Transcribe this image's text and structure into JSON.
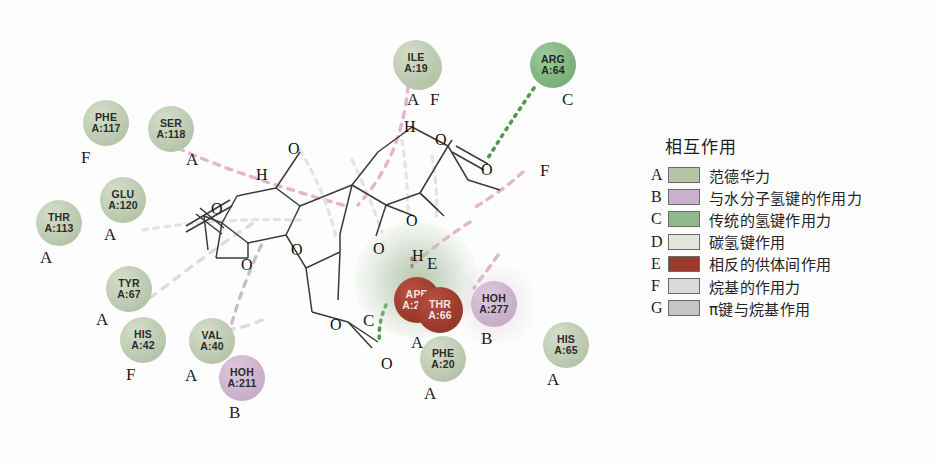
{
  "diagram": {
    "type": "2d-ligand-protein-interaction-map",
    "residues": [
      {
        "id": "ala114",
        "name": "ALA",
        "chain": "A:114",
        "tag": "F",
        "x": 396,
        "y": 44,
        "d": 46,
        "style": "vdw",
        "tag_dx": 34,
        "tag_dy": 46
      },
      {
        "id": "ile19",
        "name": "ILE",
        "chain": "A:19",
        "tag": "A",
        "x": 393,
        "y": 40,
        "d": 46,
        "style": "vdw",
        "tag_dx": 14,
        "tag_dy": 50
      },
      {
        "id": "arg64",
        "name": "ARG",
        "chain": "A:64",
        "tag": "C",
        "x": 530,
        "y": 42,
        "d": 46,
        "style": "conv",
        "tag_dx": 32,
        "tag_dy": 48
      },
      {
        "id": "phe117",
        "name": "PHE",
        "chain": "A:117",
        "tag": "F",
        "x": 83,
        "y": 100,
        "d": 46,
        "style": "vdw",
        "tag_dx": -2,
        "tag_dy": 48
      },
      {
        "id": "ser118",
        "name": "SER",
        "chain": "A:118",
        "tag": "A",
        "x": 148,
        "y": 106,
        "d": 46,
        "style": "vdw",
        "tag_dx": 38,
        "tag_dy": 44
      },
      {
        "id": "glu120",
        "name": "GLU",
        "chain": "A:120",
        "tag": "A",
        "x": 100,
        "y": 177,
        "d": 46,
        "style": "vdw",
        "tag_dx": 4,
        "tag_dy": 48
      },
      {
        "id": "thr113",
        "name": "THR",
        "chain": "A:113",
        "tag": "A",
        "x": 36,
        "y": 200,
        "d": 46,
        "style": "vdw",
        "tag_dx": 4,
        "tag_dy": 48
      },
      {
        "id": "tyr67",
        "name": "TYR",
        "chain": "A:67",
        "tag": "A",
        "x": 106,
        "y": 266,
        "d": 46,
        "style": "vdw",
        "tag_dx": -10,
        "tag_dy": 44
      },
      {
        "id": "his42",
        "name": "HIS",
        "chain": "A:42",
        "tag": "F",
        "x": 120,
        "y": 317,
        "d": 46,
        "style": "vdw",
        "tag_dx": 6,
        "tag_dy": 48
      },
      {
        "id": "val40",
        "name": "VAL",
        "chain": "A:40",
        "tag": "A",
        "x": 189,
        "y": 318,
        "d": 46,
        "style": "vdw",
        "tag_dx": -4,
        "tag_dy": 48
      },
      {
        "id": "hoh211",
        "name": "HOH",
        "chain": "A:211",
        "tag": "B",
        "x": 219,
        "y": 355,
        "d": 46,
        "style": "hoh",
        "tag_dx": 10,
        "tag_dy": 48
      },
      {
        "id": "apb208",
        "name": "APB",
        "chain": "A:208",
        "tag": "",
        "x": 394,
        "y": 277,
        "d": 46,
        "style": "unfav",
        "tag_dx": 0,
        "tag_dy": 0
      },
      {
        "id": "thr66",
        "name": "THR",
        "chain": "A:66",
        "tag": "A",
        "x": 417,
        "y": 287,
        "d": 46,
        "style": "unfav",
        "tag_dx": -6,
        "tag_dy": 46
      },
      {
        "id": "hoh277",
        "name": "HOH",
        "chain": "A:277",
        "tag": "B",
        "x": 471,
        "y": 281,
        "d": 46,
        "style": "hoh",
        "tag_dx": 10,
        "tag_dy": 48
      },
      {
        "id": "phe20",
        "name": "PHE",
        "chain": "A:20",
        "tag": "A",
        "x": 420,
        "y": 336,
        "d": 46,
        "style": "vdw",
        "tag_dx": 4,
        "tag_dy": 48
      },
      {
        "id": "his65",
        "name": "HIS",
        "chain": "A:65",
        "tag": "A",
        "x": 543,
        "y": 322,
        "d": 46,
        "style": "vdw",
        "tag_dx": 4,
        "tag_dy": 48
      }
    ],
    "atom_labels": [
      {
        "t": "O",
        "x": 288,
        "y": 140
      },
      {
        "t": "H",
        "x": 256,
        "y": 166
      },
      {
        "t": "H",
        "x": 404,
        "y": 118
      },
      {
        "t": "O",
        "x": 435,
        "y": 131
      },
      {
        "t": "O",
        "x": 481,
        "y": 161
      },
      {
        "t": "O",
        "x": 211,
        "y": 200
      },
      {
        "t": "O",
        "x": 241,
        "y": 256
      },
      {
        "t": "O",
        "x": 291,
        "y": 241
      },
      {
        "t": "O",
        "x": 373,
        "y": 240
      },
      {
        "t": "O",
        "x": 406,
        "y": 212
      },
      {
        "t": "H",
        "x": 412,
        "y": 247
      },
      {
        "t": "O",
        "x": 330,
        "y": 316
      },
      {
        "t": "O",
        "x": 381,
        "y": 355
      }
    ],
    "interaction_tags_free": [
      {
        "t": "E",
        "x": 427,
        "y": 254
      },
      {
        "t": "C",
        "x": 363,
        "y": 311
      },
      {
        "t": "F",
        "x": 540,
        "y": 161
      }
    ]
  },
  "legend": {
    "title": "相互作用",
    "items": [
      {
        "letter": "A",
        "color": "#b6c5a6",
        "label": "范德华力"
      },
      {
        "letter": "B",
        "color": "#c9b1cb",
        "label": "与水分子氢键的作用力"
      },
      {
        "letter": "C",
        "color": "#8fb88b",
        "label": "传统的氢键作用力"
      },
      {
        "letter": "D",
        "color": "#e0e6dc",
        "label": "碳氢键作用"
      },
      {
        "letter": "E",
        "color": "#9a3a2c",
        "label": "相反的供体间作用"
      },
      {
        "letter": "F",
        "color": "#d9d9d9",
        "label": "烷基的作用力"
      },
      {
        "letter": "G",
        "color": "#c5c5c5",
        "label": "π键与烷基作用"
      }
    ]
  }
}
